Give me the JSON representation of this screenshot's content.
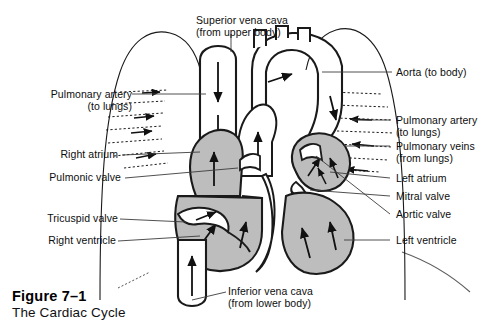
{
  "figure": {
    "caption_title": "Figure 7–1",
    "caption_subtitle": "The Cardiac Cycle",
    "width": 503,
    "height": 333
  },
  "colors": {
    "background": "#ffffff",
    "ink": "#111111",
    "outline": "#1a1a1a",
    "chamber_fill": "#bdbdbd",
    "vessel_fill": "#ffffff",
    "leader_line": "#3c3c3c"
  },
  "labels": {
    "top": [
      {
        "id": "superior-vena-cava",
        "line1": "Superior vena cava",
        "line2": "(from upper body)",
        "side": "top"
      }
    ],
    "left": [
      {
        "id": "pulmonary-artery-left",
        "line1": "Pulmonary artery",
        "line2": "(to lungs)",
        "side": "left"
      },
      {
        "id": "right-atrium",
        "line1": "Right atrium",
        "line2": "",
        "side": "left"
      },
      {
        "id": "pulmonic-valve",
        "line1": "Pulmonic valve",
        "line2": "",
        "side": "left"
      },
      {
        "id": "tricuspid-valve",
        "line1": "Tricuspid valve",
        "line2": "",
        "side": "left"
      },
      {
        "id": "right-ventricle",
        "line1": "Right ventricle",
        "line2": "",
        "side": "left"
      }
    ],
    "right": [
      {
        "id": "aorta",
        "line1": "Aorta (to body)",
        "line2": "",
        "side": "right"
      },
      {
        "id": "pulmonary-artery-right",
        "line1": "Pulmonary artery",
        "line2": "(to lungs)",
        "side": "right"
      },
      {
        "id": "pulmonary-veins",
        "line1": "Pulmonary veins",
        "line2": "(from lungs)",
        "side": "right"
      },
      {
        "id": "left-atrium",
        "line1": "Left atrium",
        "line2": "",
        "side": "right"
      },
      {
        "id": "mitral-valve",
        "line1": "Mitral valve",
        "line2": "",
        "side": "right"
      },
      {
        "id": "aortic-valve",
        "line1": "Aortic valve",
        "line2": "",
        "side": "right"
      },
      {
        "id": "left-ventricle",
        "line1": "Left ventricle",
        "line2": "",
        "side": "right"
      }
    ],
    "bottom": [
      {
        "id": "inferior-vena-cava",
        "line1": "Inferior vena cava",
        "line2": "(from lower body)",
        "side": "bottom"
      }
    ]
  },
  "structures": {
    "chambers": [
      "right atrium",
      "right ventricle",
      "left atrium",
      "left ventricle"
    ],
    "valves": [
      "pulmonic valve",
      "tricuspid valve",
      "mitral valve",
      "aortic valve"
    ],
    "great_vessels": [
      "aorta",
      "pulmonary artery",
      "pulmonary veins",
      "superior vena cava",
      "inferior vena cava"
    ],
    "flow_direction_notes": [
      "superior vena cava inflow downward",
      "inferior vena cava inflow upward",
      "right ventricle outflow to pulmonary artery",
      "pulmonary veins inflow to left atrium",
      "left ventricle outflow to aorta"
    ]
  }
}
